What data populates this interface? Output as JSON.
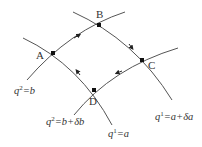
{
  "diagram": {
    "type": "curvilinear coordinate cell",
    "points": [
      {
        "id": "A",
        "label": "A",
        "x": 53,
        "y": 53
      },
      {
        "id": "B",
        "label": "B",
        "x": 99,
        "y": 25
      },
      {
        "id": "C",
        "label": "C",
        "x": 142,
        "y": 60
      },
      {
        "id": "D",
        "label": "D",
        "x": 94,
        "y": 90
      }
    ],
    "curve_labels": {
      "q2_b": {
        "base": "q",
        "sup": "2",
        "rest": "=b"
      },
      "q2_b_db": {
        "base": "q",
        "sup": "2",
        "rest": "=b+δb"
      },
      "q1_a": {
        "base": "q",
        "sup": "1",
        "rest": "=a"
      },
      "q1_a_da": {
        "base": "q",
        "sup": "1",
        "rest": "=a+δa"
      }
    },
    "circuit": [
      "A",
      "B",
      "C",
      "D",
      "A"
    ],
    "colors": {
      "line": "#555555",
      "point": "#111111",
      "text": "#333333"
    }
  }
}
